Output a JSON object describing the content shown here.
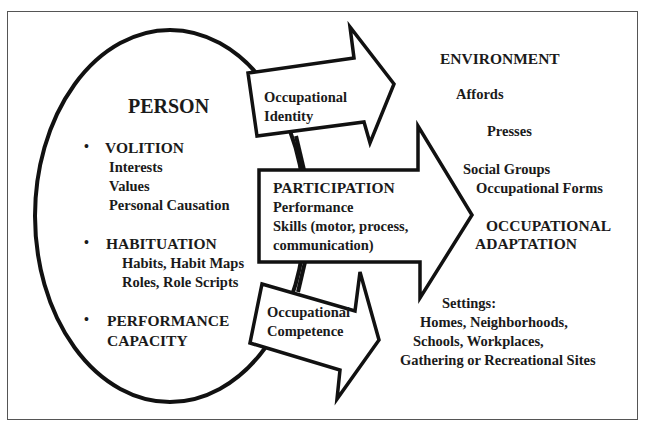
{
  "person": {
    "title": "PERSON",
    "sections": [
      {
        "heading": "VOLITION",
        "items": [
          "Interests",
          "Values",
          "Personal Causation"
        ]
      },
      {
        "heading": "HABITUATION",
        "items": [
          "Habits, Habit Maps",
          "Roles, Role Scripts"
        ]
      },
      {
        "heading": "PERFORMANCE",
        "heading2": "CAPACITY",
        "items": []
      }
    ],
    "bullet": "•"
  },
  "arrows": {
    "identity": {
      "line1": "Occupational",
      "line2": "Identity"
    },
    "participation": {
      "heading": "PARTICIPATION",
      "line1": "Performance",
      "line2": "Skills (motor, process,",
      "line3": "communication)"
    },
    "competence": {
      "line1": "Occupational",
      "line2": "Competence"
    }
  },
  "environment": {
    "title": "ENVIRONMENT",
    "affords": "Affords",
    "presses": "Presses",
    "social_groups": "Social Groups",
    "occupational_forms": "Occupational Forms",
    "settings_label": "Settings:",
    "settings": [
      "Homes, Neighborhoods,",
      "Schools, Workplaces,",
      "Gathering or Recreational Sites"
    ]
  },
  "outcome": {
    "line1": "OCCUPATIONAL",
    "line2": "ADAPTATION"
  },
  "colors": {
    "stroke": "#111111",
    "frame": "#555555",
    "background": "#ffffff"
  }
}
